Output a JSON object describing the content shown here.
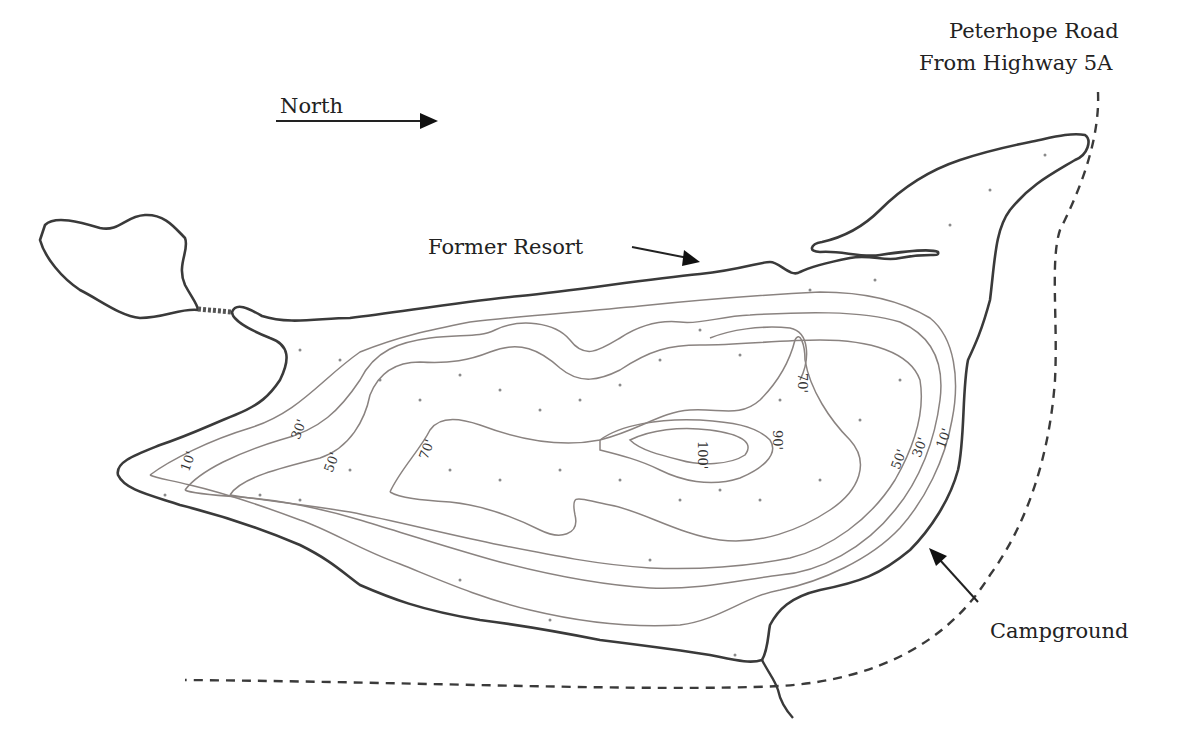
{
  "map": {
    "type": "bathymetric lake map",
    "colors": {
      "shoreline": "#3a3a3a",
      "contour": "#8a8380",
      "road": "#3a3a3a",
      "background": "#ffffff",
      "text": "#222222"
    }
  },
  "labels": {
    "north": "North",
    "road_line1": "Peterhope Road",
    "road_line2": "From Highway 5A",
    "former_resort": "Former Resort",
    "campground": "Campground"
  },
  "depth_contours": {
    "unit": "feet",
    "labels": [
      {
        "value": "10'",
        "x": 186,
        "y": 465
      },
      {
        "value": "30'",
        "x": 297,
        "y": 432
      },
      {
        "value": "50'",
        "x": 330,
        "y": 465
      },
      {
        "value": "70'",
        "x": 425,
        "y": 452
      },
      {
        "value": "70'",
        "x": 803,
        "y": 380
      },
      {
        "value": "90'",
        "x": 778,
        "y": 437
      },
      {
        "value": "100'",
        "x": 703,
        "y": 452
      },
      {
        "value": "50'",
        "x": 897,
        "y": 462
      },
      {
        "value": "30'",
        "x": 918,
        "y": 450
      },
      {
        "value": "10'",
        "x": 942,
        "y": 441
      }
    ],
    "levels_ft": [
      10,
      30,
      50,
      70,
      90,
      100
    ]
  }
}
